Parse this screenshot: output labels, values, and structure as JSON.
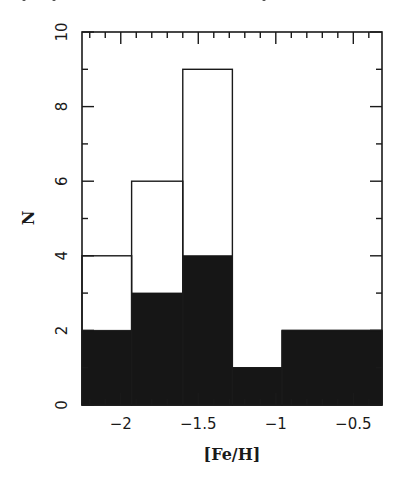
{
  "chart_data": {
    "type": "bar",
    "subtype": "overlaid-histogram",
    "title": "",
    "xlabel": "[Fe/H]",
    "ylabel": "N",
    "xlim": [
      -2.25,
      -0.315
    ],
    "ylim": [
      0,
      10
    ],
    "grid": false,
    "legend": null,
    "bin_edges": [
      -2.25,
      -1.93,
      -1.6,
      -1.28,
      -0.96,
      -0.315
    ],
    "series": [
      {
        "name": "all (open histogram)",
        "style": "outline",
        "color": "#1a1a1a",
        "values": [
          4,
          6,
          9,
          1,
          2
        ]
      },
      {
        "name": "subset (filled histogram)",
        "style": "filled",
        "color": "#161616",
        "values": [
          2,
          3,
          4,
          1,
          2
        ]
      }
    ],
    "xticks": {
      "major": [
        -2,
        -1.5,
        -1,
        -0.5
      ],
      "labels": [
        "−2",
        "−1.5",
        "−1",
        "−0.5"
      ],
      "minor_step": 0.1
    },
    "yticks": {
      "major": [
        0,
        2,
        4,
        6,
        8,
        10
      ],
      "labels": [
        "0",
        "2",
        "4",
        "6",
        "8",
        "10"
      ],
      "minor_step": 1
    }
  },
  "labels": {
    "x": "[Fe/H]",
    "y": "N"
  }
}
